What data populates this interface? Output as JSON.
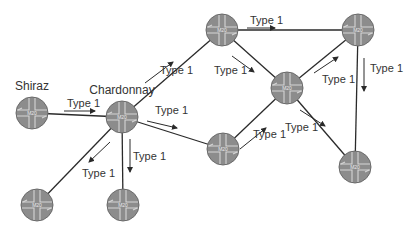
{
  "colors": {
    "router_fill": "#8c8c8c",
    "router_stroke": "#6a6a6a",
    "router_cross": "#d6d6d6",
    "link": "#2a2a2a",
    "text": "#333333"
  },
  "router_model": "M20",
  "nodes": [
    {
      "id": "shiraz",
      "name": "Shiraz",
      "x": 32,
      "y": 113
    },
    {
      "id": "chardonnay",
      "name": "Chardonnay",
      "x": 122,
      "y": 117
    },
    {
      "id": "top-center",
      "name": "",
      "x": 222,
      "y": 30
    },
    {
      "id": "top-right",
      "name": "",
      "x": 358,
      "y": 30
    },
    {
      "id": "middle-right",
      "name": "",
      "x": 287,
      "y": 88
    },
    {
      "id": "center-bottom",
      "name": "",
      "x": 223,
      "y": 149
    },
    {
      "id": "bottom-right",
      "name": "",
      "x": 355,
      "y": 167
    },
    {
      "id": "bottom-left",
      "name": "",
      "x": 37,
      "y": 205
    },
    {
      "id": "bottom-mid",
      "name": "",
      "x": 123,
      "y": 205
    }
  ],
  "edges": [
    {
      "from": "shiraz",
      "to": "chardonnay",
      "label": "Type 1"
    },
    {
      "from": "chardonnay",
      "to": "top-center",
      "label": "Type 1"
    },
    {
      "from": "chardonnay",
      "to": "center-bottom",
      "label": "Type 1"
    },
    {
      "from": "chardonnay",
      "to": "bottom-left",
      "label": "Type 1"
    },
    {
      "from": "chardonnay",
      "to": "bottom-mid",
      "label": "Type 1"
    },
    {
      "from": "top-center",
      "to": "top-right",
      "label": "Type 1"
    },
    {
      "from": "top-center",
      "to": "middle-right",
      "label": "Type 1"
    },
    {
      "from": "center-bottom",
      "to": "middle-right",
      "label": "Type 1"
    },
    {
      "from": "middle-right",
      "to": "top-right",
      "label": "Type 1"
    },
    {
      "from": "middle-right",
      "to": "bottom-right",
      "label": "Type 1"
    },
    {
      "from": "top-right",
      "to": "bottom-right",
      "label": "Type 1"
    }
  ],
  "edge_labels": [
    {
      "text": "Type 1",
      "x": 67,
      "y": 107
    },
    {
      "text": "Type 1",
      "x": 160,
      "y": 74
    },
    {
      "text": "Type 1",
      "x": 155,
      "y": 114
    },
    {
      "text": "Type 1",
      "x": 82,
      "y": 177
    },
    {
      "text": "Type 1",
      "x": 133,
      "y": 160
    },
    {
      "text": "Type 1",
      "x": 250,
      "y": 24
    },
    {
      "text": "Type 1",
      "x": 214,
      "y": 74
    },
    {
      "text": "Type 1",
      "x": 253,
      "y": 138
    },
    {
      "text": "Type 1",
      "x": 322,
      "y": 83
    },
    {
      "text": "Type 1",
      "x": 285,
      "y": 131
    },
    {
      "text": "Type 1",
      "x": 370,
      "y": 72
    }
  ],
  "arrows": [
    {
      "x1": 64,
      "y1": 111,
      "x2": 95,
      "y2": 111
    },
    {
      "x1": 145,
      "y1": 83,
      "x2": 173,
      "y2": 62
    },
    {
      "x1": 147,
      "y1": 121,
      "x2": 177,
      "y2": 128
    },
    {
      "x1": 110,
      "y1": 142,
      "x2": 89,
      "y2": 162
    },
    {
      "x1": 130,
      "y1": 139,
      "x2": 130,
      "y2": 172
    },
    {
      "x1": 247,
      "y1": 28,
      "x2": 275,
      "y2": 28
    },
    {
      "x1": 232,
      "y1": 56,
      "x2": 254,
      "y2": 72
    },
    {
      "x1": 240,
      "y1": 149,
      "x2": 266,
      "y2": 128
    },
    {
      "x1": 314,
      "y1": 73,
      "x2": 338,
      "y2": 57
    },
    {
      "x1": 300,
      "y1": 110,
      "x2": 325,
      "y2": 126
    },
    {
      "x1": 364,
      "y1": 58,
      "x2": 364,
      "y2": 91
    }
  ]
}
